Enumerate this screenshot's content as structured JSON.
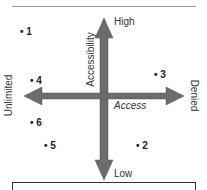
{
  "diagram": {
    "vertical_axis": {
      "title": "Accessibility",
      "top_label": "High",
      "bottom_label": "Low"
    },
    "horizontal_axis": {
      "title": "Access",
      "left_label": "Unlimited",
      "right_label": "Denied"
    },
    "points": [
      {
        "label": "1",
        "x": 23,
        "y": 32
      },
      {
        "label": "2",
        "x": 139,
        "y": 146
      },
      {
        "label": "3",
        "x": 157,
        "y": 75
      },
      {
        "label": "4",
        "x": 33,
        "y": 81
      },
      {
        "label": "5",
        "x": 47,
        "y": 146
      },
      {
        "label": "6",
        "x": 33,
        "y": 123
      }
    ],
    "arrow_color": "#6b6b6b"
  }
}
